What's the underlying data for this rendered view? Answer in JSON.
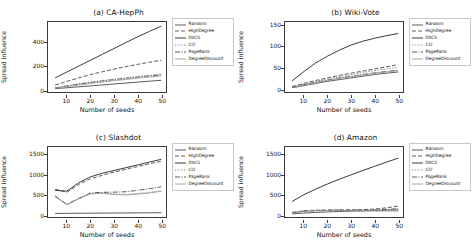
{
  "figure": {
    "xlabel": "Number of seeds",
    "ylabel": "Spread influence",
    "legend_position": "right",
    "grid": false
  },
  "series_names": [
    "Random",
    "HighDegree",
    "DIICS",
    "CI2",
    "PageRank",
    "DegreeDiscount"
  ],
  "series_styles": [
    {
      "name": "Random",
      "color": "#4a4a4a",
      "dash": "none",
      "width": 0.9
    },
    {
      "name": "HighDegree",
      "color": "#4a4a4a",
      "dash": "4,2",
      "width": 0.9
    },
    {
      "name": "DIICS",
      "color": "#3a3a3a",
      "dash": "none",
      "width": 1.0
    },
    {
      "name": "CI2",
      "color": "#8a8a8a",
      "dash": "1.5,1.5",
      "width": 0.9
    },
    {
      "name": "PageRank",
      "color": "#4a4a4a",
      "dash": "5,1.5,1,1.5",
      "width": 0.9
    },
    {
      "name": "DegreeDiscount",
      "color": "#9a9a9a",
      "dash": "none",
      "width": 0.9
    }
  ],
  "chart_data": [
    {
      "type": "line",
      "title": "(a) CA-HepPh",
      "xlabel": "Number of seeds",
      "ylabel": "Spread influence",
      "x": [
        5,
        10,
        15,
        20,
        25,
        30,
        35,
        40,
        45,
        50
      ],
      "xlim": [
        2,
        52
      ],
      "ylim": [
        -20,
        575
      ],
      "xticks": [
        10,
        20,
        30,
        40,
        50
      ],
      "yticks": [
        0,
        200,
        400
      ],
      "series": [
        {
          "name": "Random",
          "values": [
            8,
            16,
            24,
            32,
            40,
            48,
            56,
            64,
            72,
            80
          ]
        },
        {
          "name": "HighDegree",
          "values": [
            38,
            70,
            100,
            128,
            152,
            175,
            196,
            215,
            233,
            250
          ]
        },
        {
          "name": "DIICS",
          "values": [
            100,
            150,
            200,
            250,
            300,
            350,
            400,
            450,
            495,
            540
          ]
        },
        {
          "name": "CI2",
          "values": [
            15,
            33,
            50,
            64,
            78,
            90,
            101,
            112,
            122,
            132
          ]
        },
        {
          "name": "PageRank",
          "values": [
            14,
            30,
            46,
            60,
            73,
            85,
            96,
            107,
            117,
            127
          ]
        },
        {
          "name": "DegreeDiscount",
          "values": [
            12,
            26,
            40,
            53,
            65,
            76,
            87,
            97,
            107,
            117
          ]
        }
      ]
    },
    {
      "type": "line",
      "title": "(b) Wiki-Vote",
      "xlabel": "Number of seeds",
      "ylabel": "Spread influence",
      "x": [
        5,
        10,
        15,
        20,
        25,
        30,
        35,
        40,
        45,
        50
      ],
      "xlim": [
        2,
        52
      ],
      "ylim": [
        -6,
        158
      ],
      "xticks": [
        10,
        20,
        30,
        40,
        50
      ],
      "yticks": [
        0,
        50,
        100,
        150
      ],
      "series": [
        {
          "name": "Random",
          "values": [
            4,
            9,
            14,
            19,
            23,
            27,
            31,
            35,
            38,
            41
          ]
        },
        {
          "name": "HighDegree",
          "values": [
            7,
            14,
            21,
            27,
            33,
            38,
            43,
            48,
            53,
            58
          ]
        },
        {
          "name": "DIICS",
          "values": [
            20,
            42,
            62,
            78,
            92,
            104,
            113,
            120,
            126,
            131
          ]
        },
        {
          "name": "CI2",
          "values": [
            6,
            13,
            19,
            25,
            30,
            35,
            40,
            44,
            48,
            52
          ]
        },
        {
          "name": "PageRank",
          "values": [
            5,
            11,
            17,
            22,
            27,
            31,
            35,
            39,
            42,
            45
          ]
        },
        {
          "name": "DegreeDiscount",
          "values": [
            5,
            10,
            16,
            21,
            26,
            30,
            34,
            38,
            41,
            44
          ]
        }
      ]
    },
    {
      "type": "line",
      "title": "(c) Slashdot",
      "xlabel": "Number of seeds",
      "ylabel": "Spread influence",
      "x": [
        5,
        10,
        15,
        20,
        25,
        30,
        35,
        40,
        45,
        50
      ],
      "xlim": [
        2,
        52
      ],
      "ylim": [
        -60,
        1700
      ],
      "xticks": [
        10,
        20,
        30,
        40,
        50
      ],
      "yticks": [
        0,
        500,
        1000,
        1500
      ],
      "series": [
        {
          "name": "Random",
          "values": [
            30,
            32,
            34,
            36,
            38,
            40,
            42,
            44,
            46,
            48
          ]
        },
        {
          "name": "HighDegree",
          "values": [
            640,
            560,
            760,
            900,
            990,
            1070,
            1140,
            1210,
            1280,
            1340
          ]
        },
        {
          "name": "DIICS",
          "values": [
            610,
            590,
            800,
            950,
            1040,
            1110,
            1180,
            1250,
            1320,
            1390
          ]
        },
        {
          "name": "CI2",
          "values": [
            460,
            250,
            400,
            530,
            545,
            520,
            510,
            530,
            560,
            600
          ]
        },
        {
          "name": "PageRank",
          "values": [
            470,
            260,
            410,
            545,
            560,
            565,
            575,
            610,
            650,
            700
          ]
        },
        {
          "name": "DegreeDiscount",
          "values": [
            455,
            245,
            395,
            520,
            535,
            505,
            495,
            515,
            545,
            585
          ]
        }
      ]
    },
    {
      "type": "line",
      "title": "(d) Amazon",
      "xlabel": "Number of seeds",
      "ylabel": "Spread influence",
      "x": [
        5,
        10,
        15,
        20,
        25,
        30,
        35,
        40,
        45,
        50
      ],
      "xlim": [
        2,
        52
      ],
      "ylim": [
        -60,
        1700
      ],
      "xticks": [
        10,
        20,
        30,
        40,
        50
      ],
      "yticks": [
        0,
        500,
        1000,
        1500
      ],
      "series": [
        {
          "name": "Random",
          "values": [
            20,
            40,
            55,
            68,
            78,
            88,
            96,
            104,
            112,
            120
          ]
        },
        {
          "name": "HighDegree",
          "values": [
            55,
            95,
            110,
            115,
            118,
            120,
            125,
            140,
            170,
            215
          ]
        },
        {
          "name": "DIICS",
          "values": [
            330,
            500,
            640,
            770,
            890,
            1000,
            1110,
            1215,
            1320,
            1420
          ]
        },
        {
          "name": "CI2",
          "values": [
            45,
            85,
            100,
            105,
            105,
            103,
            100,
            98,
            97,
            96
          ]
        },
        {
          "name": "PageRank",
          "values": [
            50,
            90,
            105,
            110,
            112,
            112,
            113,
            118,
            130,
            150
          ]
        },
        {
          "name": "DegreeDiscount",
          "values": [
            42,
            80,
            95,
            100,
            100,
            98,
            95,
            93,
            92,
            92
          ]
        }
      ]
    }
  ]
}
